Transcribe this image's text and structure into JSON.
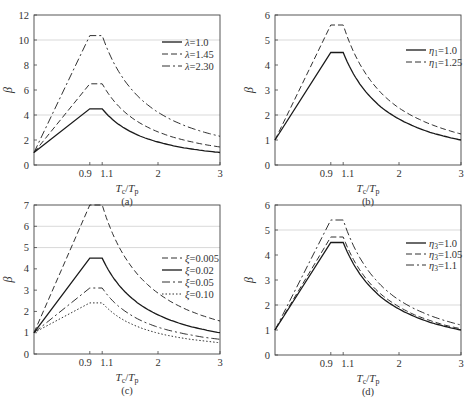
{
  "chart_data": [
    {
      "type": "line",
      "panel_label": "(a)",
      "xlabel": "Tc/Tp",
      "ylabel": "β",
      "xlim": [
        0,
        3
      ],
      "ylim": [
        0,
        12
      ],
      "xticks": [
        0.9,
        1.1,
        2,
        3
      ],
      "xtick_labels": [
        "0.9",
        "1.1",
        "2",
        "3"
      ],
      "yticks": [
        0,
        2,
        4,
        6,
        8,
        10,
        12
      ],
      "gridlines_y": [
        4,
        10
      ],
      "legend_position": "upper right",
      "x": [
        0,
        0.9,
        1.1,
        1.3,
        1.5,
        1.75,
        2.0,
        2.25,
        2.5,
        2.75,
        3.0
      ],
      "series": [
        {
          "name": "λ=1.0",
          "style": "solid",
          "values": [
            1,
            4.5,
            4.5,
            3.5,
            2.83,
            2.24,
            1.84,
            1.54,
            1.31,
            1.14,
            1.0
          ]
        },
        {
          "name": "λ=1.45",
          "style": "dashed",
          "values": [
            1,
            6.5,
            6.5,
            5.06,
            4.08,
            3.24,
            2.65,
            2.22,
            1.9,
            1.64,
            1.44
          ]
        },
        {
          "name": "λ=2.30",
          "style": "dashdot",
          "values": [
            1,
            10.35,
            10.35,
            8.05,
            6.5,
            5.15,
            4.22,
            3.54,
            3.02,
            2.62,
            2.3
          ]
        }
      ]
    },
    {
      "type": "line",
      "panel_label": "(b)",
      "xlabel": "Tc/Tp",
      "ylabel": "β",
      "xlim": [
        0,
        3
      ],
      "ylim": [
        0,
        6
      ],
      "xticks": [
        0.9,
        1.1,
        2,
        3
      ],
      "xtick_labels": [
        "0.9",
        "1.1",
        "2",
        "3"
      ],
      "yticks": [
        0,
        1,
        2,
        3,
        4,
        5,
        6
      ],
      "gridlines_y": [
        2,
        5
      ],
      "legend_position": "upper right",
      "x": [
        0,
        0.9,
        1.1,
        1.3,
        1.5,
        1.75,
        2.0,
        2.25,
        2.5,
        2.75,
        3.0
      ],
      "series": [
        {
          "name": "η1=1.0",
          "style": "solid",
          "values": [
            1,
            4.5,
            4.5,
            3.5,
            2.83,
            2.24,
            1.84,
            1.54,
            1.31,
            1.14,
            1.0
          ]
        },
        {
          "name": "η1=1.25",
          "style": "dashed",
          "values": [
            1,
            5.6,
            5.6,
            4.36,
            3.52,
            2.79,
            2.28,
            1.92,
            1.64,
            1.42,
            1.24
          ]
        }
      ]
    },
    {
      "type": "line",
      "panel_label": "(c)",
      "xlabel": "Tc/Tp",
      "ylabel": "β",
      "xlim": [
        0,
        3
      ],
      "ylim": [
        0,
        7
      ],
      "xticks": [
        0.9,
        1.1,
        2,
        3
      ],
      "xtick_labels": [
        "0.9",
        "1.1",
        "2",
        "3"
      ],
      "yticks": [
        0,
        1,
        2,
        3,
        4,
        5,
        6,
        7
      ],
      "gridlines_y": [
        5,
        6
      ],
      "legend_position": "right",
      "x": [
        0,
        0.9,
        1.1,
        1.3,
        1.5,
        1.75,
        2.0,
        2.25,
        2.5,
        2.75,
        3.0
      ],
      "series": [
        {
          "name": "ξ=0.005",
          "style": "dashed",
          "values": [
            1,
            7.0,
            7.0,
            5.45,
            4.4,
            3.49,
            2.86,
            2.39,
            2.04,
            1.77,
            1.55
          ]
        },
        {
          "name": "ξ=0.02",
          "style": "solid",
          "values": [
            1,
            4.5,
            4.5,
            3.5,
            2.83,
            2.24,
            1.84,
            1.54,
            1.31,
            1.14,
            1.0
          ]
        },
        {
          "name": "ξ=0.05",
          "style": "dashdot",
          "values": [
            1,
            3.1,
            3.1,
            2.41,
            1.95,
            1.54,
            1.26,
            1.06,
            0.91,
            0.78,
            0.69
          ]
        },
        {
          "name": "ξ=0.10",
          "style": "dotted",
          "values": [
            1,
            2.4,
            2.4,
            1.87,
            1.51,
            1.2,
            0.98,
            0.82,
            0.7,
            0.61,
            0.53
          ]
        }
      ]
    },
    {
      "type": "line",
      "panel_label": "(d)",
      "xlabel": "Tc/Tp",
      "ylabel": "β",
      "xlim": [
        0,
        3
      ],
      "ylim": [
        0,
        6
      ],
      "xticks": [
        0.9,
        1.1,
        2,
        3
      ],
      "xtick_labels": [
        "0.9",
        "1.1",
        "2",
        "3"
      ],
      "yticks": [
        0,
        1,
        2,
        3,
        4,
        5,
        6
      ],
      "gridlines_y": [
        2,
        5
      ],
      "legend_position": "upper right",
      "x": [
        0,
        0.9,
        1.1,
        1.3,
        1.5,
        1.75,
        2.0,
        2.25,
        2.5,
        2.75,
        3.0
      ],
      "series": [
        {
          "name": "η3=1.0",
          "style": "solid",
          "values": [
            1,
            4.5,
            4.5,
            3.5,
            2.83,
            2.24,
            1.84,
            1.54,
            1.31,
            1.14,
            1.0
          ]
        },
        {
          "name": "η3=1.05",
          "style": "dashed",
          "values": [
            1,
            4.72,
            4.72,
            3.67,
            2.96,
            2.35,
            1.93,
            1.61,
            1.38,
            1.19,
            1.05
          ]
        },
        {
          "name": "η3=1.1",
          "style": "dashdot",
          "values": [
            1,
            5.4,
            5.4,
            4.2,
            3.39,
            2.69,
            2.2,
            1.85,
            1.58,
            1.37,
            1.2
          ]
        }
      ]
    }
  ],
  "panels": [
    {
      "label": "(a)",
      "ylabel": "β",
      "xlabel_main": "T",
      "xlabel_sub1": "c",
      "xlabel_sub2": "p",
      "legend": [
        {
          "sym": "λ",
          "sub": "",
          "val": "=1.0"
        },
        {
          "sym": "λ",
          "sub": "",
          "val": "=1.45"
        },
        {
          "sym": "λ",
          "sub": "",
          "val": "=2.30"
        }
      ]
    },
    {
      "label": "(b)",
      "ylabel": "β",
      "xlabel_main": "T",
      "xlabel_sub1": "c",
      "xlabel_sub2": "p",
      "legend": [
        {
          "sym": "η",
          "sub": "1",
          "val": "=1.0"
        },
        {
          "sym": "η",
          "sub": "1",
          "val": "=1.25"
        }
      ]
    },
    {
      "label": "(c)",
      "ylabel": "β",
      "xlabel_main": "T",
      "xlabel_sub1": "c",
      "xlabel_sub2": "p",
      "legend": [
        {
          "sym": "ξ",
          "sub": "",
          "val": "=0.005"
        },
        {
          "sym": "ξ",
          "sub": "",
          "val": "=0.02"
        },
        {
          "sym": "ξ",
          "sub": "",
          "val": "=0.05"
        },
        {
          "sym": "ξ",
          "sub": "",
          "val": "=0.10"
        }
      ]
    },
    {
      "label": "(d)",
      "ylabel": "β",
      "xlabel_main": "T",
      "xlabel_sub1": "c",
      "xlabel_sub2": "p",
      "legend": [
        {
          "sym": "η",
          "sub": "3",
          "val": "=1.0"
        },
        {
          "sym": "η",
          "sub": "3",
          "val": "=1.05"
        },
        {
          "sym": "η",
          "sub": "3",
          "val": "=1.1"
        }
      ]
    }
  ],
  "colors": {
    "line": "#1a1a1a",
    "axis": "#444444",
    "grid": "#cfcfcf",
    "text": "#333333"
  }
}
